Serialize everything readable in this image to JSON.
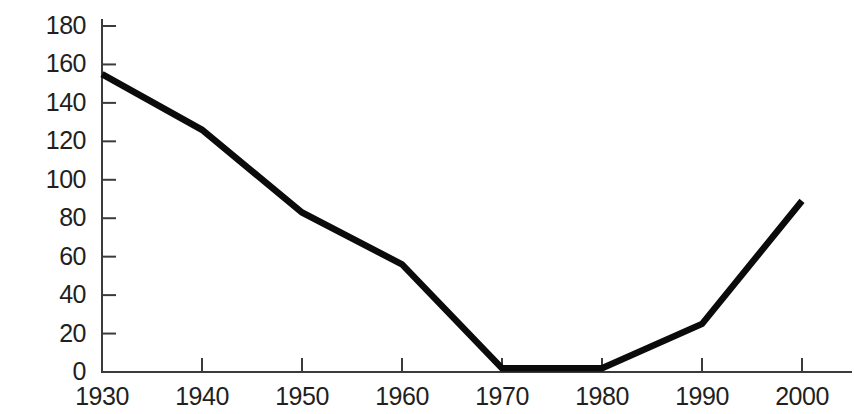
{
  "chart_data": {
    "type": "line",
    "title": "",
    "subtitle": "",
    "xlabel": "",
    "ylabel": "",
    "x": [
      1930,
      1940,
      1950,
      1960,
      1970,
      1980,
      1990,
      2000
    ],
    "xtick_labels": [
      "1930",
      "1940",
      "1950",
      "1960",
      "1970",
      "1980",
      "1990",
      "2000"
    ],
    "ytick_labels": [
      "0",
      "20",
      "40",
      "60",
      "80",
      "100",
      "120",
      "140",
      "160",
      "180"
    ],
    "ytick_values": [
      0,
      20,
      40,
      60,
      80,
      100,
      120,
      140,
      160,
      180
    ],
    "xlim": [
      1925,
      1999
    ],
    "ylim": [
      0,
      180
    ],
    "grid": false,
    "legend": false,
    "legend_position": "none",
    "series": [
      {
        "name": "series-1",
        "color": "#0b0b0b",
        "values": [
          155,
          126,
          83,
          56,
          2,
          2,
          25,
          89
        ]
      }
    ],
    "annotations": []
  },
  "axes": {
    "y_axis_name": "y-axis",
    "x_axis_name": "x-axis",
    "axis_color": "#3b3b3b"
  }
}
